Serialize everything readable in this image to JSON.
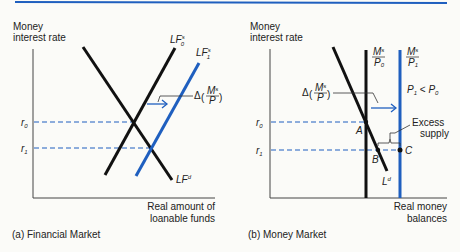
{
  "colors": {
    "black": "#111111",
    "blue": "#1f5fbf",
    "axis": "#444444",
    "text": "#222222",
    "top_rule": "#1f5fbf"
  },
  "panel_a": {
    "caption": "(a) Financial Market",
    "y_label": [
      "Money",
      "interest rate"
    ],
    "x_label": [
      "Real amount of",
      "loanable funds"
    ],
    "rate_labels": {
      "r0": "r",
      "r0_sub": "0",
      "r1": "r",
      "r1_sub": "1"
    },
    "curves": {
      "LF0s": {
        "main": "LF",
        "sup": "s",
        "sub": "0"
      },
      "LF1s": {
        "main": "LF",
        "sup": "s",
        "sub": "1"
      },
      "LFd": {
        "main": "LF",
        "sup": "d"
      }
    },
    "shift_label": {
      "delta": "Δ",
      "num": "M",
      "num_sup": "s",
      "den": "P"
    }
  },
  "panel_b": {
    "caption": "(b) Money Market",
    "y_label": [
      "Money",
      "interest rate"
    ],
    "x_label": [
      "Real money",
      "balances"
    ],
    "rate_labels": {
      "r0": "r",
      "r0_sub": "0",
      "r1": "r",
      "r1_sub": "1"
    },
    "curves": {
      "MsP0": {
        "num": "M",
        "num_sup": "s",
        "den": "P",
        "den_sub": "0"
      },
      "MsP1": {
        "num": "M",
        "num_sup": "s",
        "den": "P",
        "den_sub": "1"
      },
      "Ld": {
        "main": "L",
        "sup": "d"
      }
    },
    "condition": {
      "a": "P",
      "a_sub": "1",
      "op": " < ",
      "b": "P",
      "b_sub": "0"
    },
    "shift_label": {
      "delta": "Δ",
      "num": "M",
      "num_sup": "s",
      "den": "P"
    },
    "points": {
      "A": "A",
      "B": "B",
      "C": "C"
    },
    "excess_label": [
      "Excess",
      "supply"
    ]
  }
}
